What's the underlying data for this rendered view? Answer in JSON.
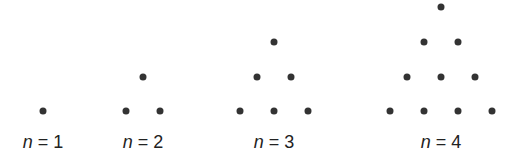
{
  "diagram": {
    "type": "triangular-dot-pattern",
    "dot_color": "#333333",
    "figures": [
      {
        "label_var": "n",
        "label_eq": " = 1",
        "center_x": 43,
        "dots": [
          [
            43,
            111
          ]
        ]
      },
      {
        "label_var": "n",
        "label_eq": " = 2",
        "center_x": 143,
        "dots": [
          [
            143,
            77
          ],
          [
            126,
            111
          ],
          [
            160,
            111
          ]
        ]
      },
      {
        "label_var": "n",
        "label_eq": " = 3",
        "center_x": 274,
        "dots": [
          [
            274,
            42
          ],
          [
            257,
            77
          ],
          [
            291,
            77
          ],
          [
            240,
            111
          ],
          [
            274,
            111
          ],
          [
            308,
            111
          ]
        ]
      },
      {
        "label_var": "n",
        "label_eq": " = 4",
        "center_x": 441,
        "dots": [
          [
            441,
            7
          ],
          [
            424,
            42
          ],
          [
            458,
            42
          ],
          [
            407,
            77
          ],
          [
            441,
            77
          ],
          [
            475,
            77
          ],
          [
            390,
            111
          ],
          [
            424,
            111
          ],
          [
            458,
            111
          ],
          [
            492,
            111
          ]
        ]
      }
    ]
  }
}
